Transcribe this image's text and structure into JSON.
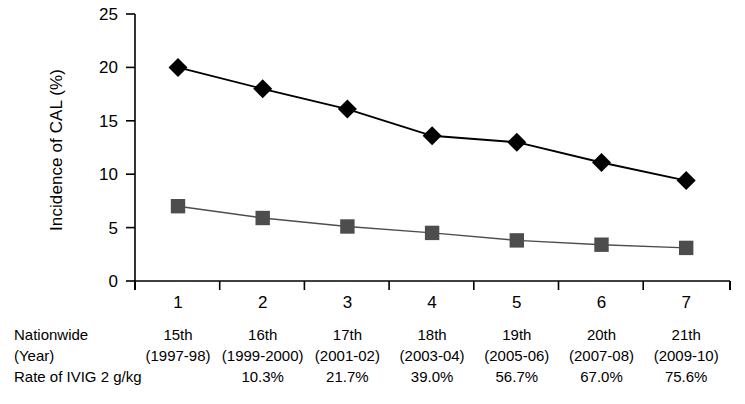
{
  "chart_data": {
    "type": "line",
    "title": "",
    "xlabel": "",
    "ylabel": "Incidence of CAL (%)",
    "ylim": [
      0,
      25
    ],
    "yticks": [
      0,
      5,
      10,
      15,
      20,
      25
    ],
    "grid": false,
    "legend_position": "none",
    "x": [
      1,
      2,
      3,
      4,
      5,
      6,
      7
    ],
    "xtick_labels": [
      "1",
      "2",
      "3",
      "4",
      "5",
      "6",
      "7"
    ],
    "series": [
      {
        "name": "CAL overall",
        "marker": "diamond",
        "color": "#000000",
        "values": [
          20.0,
          18.0,
          16.1,
          13.6,
          13.0,
          11.1,
          9.4
        ]
      },
      {
        "name": "CAL persistent",
        "marker": "square",
        "color": "#4d4d4d",
        "values": [
          7.0,
          5.9,
          5.1,
          4.5,
          3.8,
          3.4,
          3.1
        ]
      }
    ]
  },
  "bottom_table": {
    "row_labels": [
      "Nationwide",
      "(Year)",
      "Rate of IVIG 2 g/kg"
    ],
    "columns": [
      {
        "survey": "15th",
        "year": "(1997-98)",
        "ivig_rate": ""
      },
      {
        "survey": "16th",
        "year": "(1999-2000)",
        "ivig_rate": "10.3%"
      },
      {
        "survey": "17th",
        "year": "(2001-02)",
        "ivig_rate": "21.7%"
      },
      {
        "survey": "18th",
        "year": "(2003-04)",
        "ivig_rate": "39.0%"
      },
      {
        "survey": "19th",
        "year": "(2005-06)",
        "ivig_rate": "56.7%"
      },
      {
        "survey": "20th",
        "year": "(2007-08)",
        "ivig_rate": "67.0%"
      },
      {
        "survey": "21th",
        "year": "(2009-10)",
        "ivig_rate": "75.6%"
      }
    ]
  }
}
